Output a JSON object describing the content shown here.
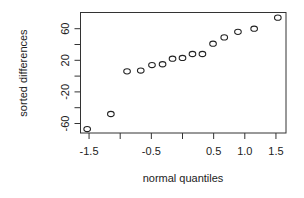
{
  "chart_data": {
    "type": "scatter",
    "title": "",
    "xlabel": "normal quantiles",
    "ylabel": "sorted differences",
    "xlim": [
      -1.6,
      1.7
    ],
    "ylim": [
      -72,
      80
    ],
    "x_ticks": [
      -1.5,
      -1.0,
      -0.5,
      0.0,
      0.5,
      1.0,
      1.5
    ],
    "x_tick_labels": [
      "-1.5",
      "",
      "-0.5",
      "",
      "0.5",
      "1.0",
      "1.5"
    ],
    "y_ticks": [
      -60,
      -40,
      -20,
      0,
      20,
      40,
      60
    ],
    "y_tick_labels": [
      "-60",
      "",
      "-20",
      "",
      "20",
      "",
      "60"
    ],
    "grid": false,
    "legend": null,
    "marker": "open-circle",
    "points": [
      {
        "x": -1.53,
        "y": -67
      },
      {
        "x": -1.15,
        "y": -48
      },
      {
        "x": -0.89,
        "y": 6
      },
      {
        "x": -0.67,
        "y": 7
      },
      {
        "x": -0.49,
        "y": 14
      },
      {
        "x": -0.32,
        "y": 15
      },
      {
        "x": -0.16,
        "y": 22
      },
      {
        "x": 0.0,
        "y": 23
      },
      {
        "x": 0.16,
        "y": 28
      },
      {
        "x": 0.32,
        "y": 28
      },
      {
        "x": 0.49,
        "y": 41
      },
      {
        "x": 0.67,
        "y": 49
      },
      {
        "x": 0.89,
        "y": 56
      },
      {
        "x": 1.15,
        "y": 60
      },
      {
        "x": 1.53,
        "y": 74
      }
    ]
  }
}
